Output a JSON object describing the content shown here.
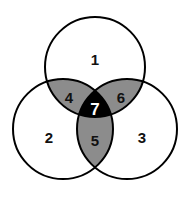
{
  "diagram": {
    "type": "venn",
    "sets": 3,
    "colors": {
      "outline": "#000000",
      "single": "#ffffff",
      "pair": "#8c8c8c",
      "triple": "#000000",
      "label_default": "#111111",
      "label_on_triple": "#ffffff"
    },
    "regions": {
      "r1": "1",
      "r2": "2",
      "r3": "3",
      "r4": "4",
      "r5": "5",
      "r6": "6",
      "r7": "7"
    }
  }
}
